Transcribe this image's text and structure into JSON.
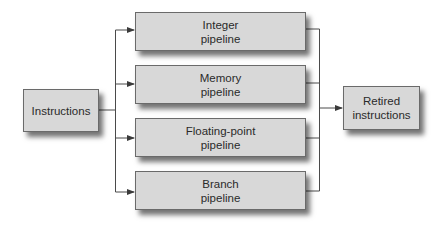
{
  "diagram": {
    "source": {
      "label": "Instructions"
    },
    "pipelines": [
      {
        "line1": "Integer",
        "line2": "pipeline"
      },
      {
        "line1": "Memory",
        "line2": "pipeline"
      },
      {
        "line1": "Floating-point",
        "line2": "pipeline"
      },
      {
        "line1": "Branch",
        "line2": "pipeline"
      }
    ],
    "sink": {
      "line1": "Retired",
      "line2": "instructions"
    },
    "colors": {
      "box_fill": "#d8d8d8",
      "box_border": "#6a6a6a",
      "line": "#4a4a4a"
    }
  }
}
